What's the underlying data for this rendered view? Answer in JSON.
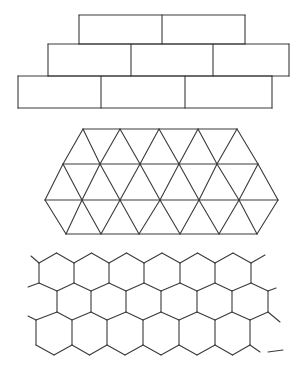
{
  "canvas": {
    "width": 305,
    "height": 377,
    "background": "#ffffff",
    "stroke": "#3a3a3a"
  },
  "figures": [
    {
      "name": "brick-tiling",
      "type": "rectangles-running-bond",
      "rows": [
        {
          "y_top": 15,
          "y_bottom": 44,
          "x_edges": [
            79,
            162,
            245
          ]
        },
        {
          "y_top": 44,
          "y_bottom": 76,
          "x_edges": [
            48,
            131,
            213,
            289
          ]
        },
        {
          "y_top": 76,
          "y_bottom": 108,
          "x_edges": [
            18,
            101,
            185,
            272
          ]
        }
      ]
    },
    {
      "name": "triangle-tiling",
      "type": "equilateral-triangles",
      "rows": [
        {
          "y": 129,
          "xs": [
            83,
            120,
            159,
            198,
            237
          ]
        },
        {
          "y": 164,
          "xs": [
            63,
            100,
            140,
            179,
            217,
            258
          ]
        },
        {
          "y": 200,
          "xs": [
            45,
            82,
            120,
            160,
            199,
            239,
            278
          ]
        },
        {
          "y": 234,
          "xs": [
            66,
            101,
            139,
            180,
            219,
            257
          ]
        }
      ]
    },
    {
      "name": "hexagon-tiling",
      "type": "pointy-top-hexagons",
      "rows": [
        {
          "edge_top": 263,
          "edge_bottom": 283,
          "xs": [
            39,
            74,
            109,
            144,
            180,
            215,
            251
          ]
        },
        {
          "edge_top": 291,
          "edge_bottom": 312,
          "xs": [
            57,
            91,
            126,
            161,
            197,
            232,
            268
          ]
        },
        {
          "edge_top": 320,
          "edge_bottom": 345,
          "xs": [
            36,
            72,
            107,
            143,
            179,
            215,
            250
          ]
        }
      ],
      "peak_top": 253,
      "peak_bottom": 355
    }
  ]
}
